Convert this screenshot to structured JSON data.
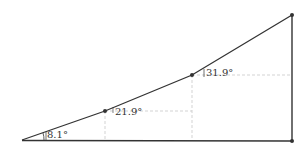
{
  "diagram": {
    "type": "geometry-slope-angles",
    "colors": {
      "line": "#333333",
      "dashed": "#bbbbbb",
      "point": "#333333",
      "text": "#333333"
    },
    "points": {
      "origin": {
        "x": 22,
        "y": 140
      },
      "p1": {
        "x": 105,
        "y": 111
      },
      "p2": {
        "x": 192,
        "y": 75
      },
      "top": {
        "x": 292,
        "y": 15
      },
      "bottom_right": {
        "x": 292,
        "y": 141
      }
    },
    "angles": [
      {
        "label": "8.1°",
        "value": 8.1,
        "at": "origin"
      },
      {
        "label": "21.9°",
        "value": 21.9,
        "at": "p1"
      },
      {
        "label": "31.9°",
        "value": 31.9,
        "at": "p2"
      }
    ]
  }
}
